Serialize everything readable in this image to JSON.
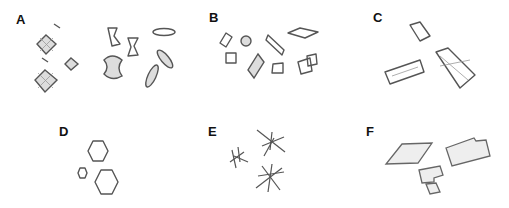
{
  "figure": {
    "panels": [
      {
        "id": "A",
        "label": "A",
        "content": "mixed crystals: octahedral/envelope, dumbbell, ovoid"
      },
      {
        "id": "B",
        "label": "B",
        "content": "rhombic and hexagonal plates, rosette"
      },
      {
        "id": "C",
        "label": "C",
        "content": "coffin-lid prisms, X-shaped twin"
      },
      {
        "id": "D",
        "label": "D",
        "content": "hexagonal plates"
      },
      {
        "id": "E",
        "label": "E",
        "content": "needle/star clusters"
      },
      {
        "id": "F",
        "label": "F",
        "content": "notched flat plates"
      }
    ]
  },
  "colors": {
    "stroke": "#555555",
    "background": "#ffffff",
    "label": "#111111"
  }
}
